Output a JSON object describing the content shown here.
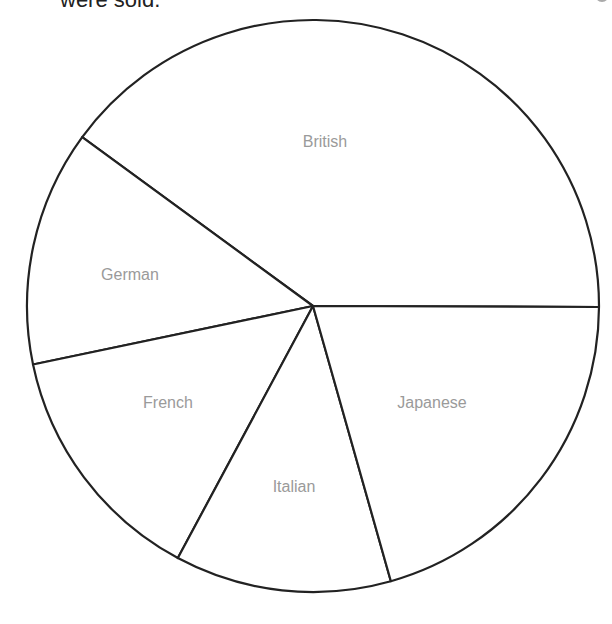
{
  "caption": "were sold.",
  "chart_data": {
    "type": "pie",
    "title": "",
    "categories": [
      "British",
      "German",
      "French",
      "Italian",
      "Japanese"
    ],
    "values": [
      144,
      48,
      50,
      44,
      74
    ],
    "units": "degrees (approx., estimated from slice angles)",
    "percentages": [
      40.0,
      13.3,
      13.9,
      12.2,
      20.6
    ],
    "start_angle_deg": 0,
    "direction": "counterclockwise",
    "legend": "none (labels inside slices)"
  }
}
